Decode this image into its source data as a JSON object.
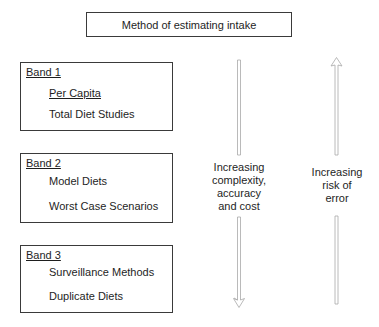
{
  "title": "Method of estimating intake",
  "bands": [
    {
      "label": "Band 1",
      "methods": [
        {
          "label": "Per Capita",
          "underlined": true
        },
        {
          "label": "Total Diet Studies",
          "underlined": false
        }
      ]
    },
    {
      "label": "Band 2",
      "methods": [
        {
          "label": "Model Diets",
          "underlined": false
        },
        {
          "label": "Worst Case Scenarios",
          "underlined": false
        }
      ]
    },
    {
      "label": "Band 3",
      "methods": [
        {
          "label": "Surveillance Methods",
          "underlined": false
        },
        {
          "label": "Duplicate Diets",
          "underlined": false
        }
      ]
    }
  ],
  "arrows": {
    "down": {
      "direction": "down",
      "label_lines": [
        "Increasing",
        "complexity,",
        "accuracy",
        "and cost"
      ]
    },
    "up": {
      "direction": "up",
      "label_lines": [
        "Increasing",
        "risk of",
        "error"
      ]
    }
  },
  "colors": {
    "border": "#3a3a3a",
    "arrow": "#9a9a9a",
    "text": "#1e1e1e"
  }
}
